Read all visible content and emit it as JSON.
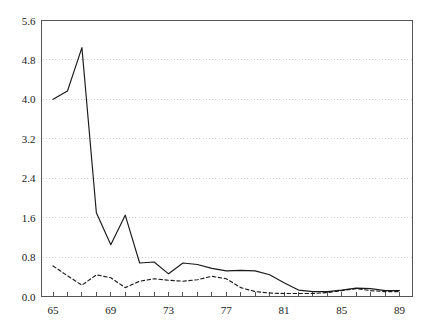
{
  "chart_data": {
    "type": "line",
    "title": "",
    "subtitle": "",
    "xlabel": "",
    "ylabel": "",
    "xlim": [
      64.2,
      89.9
    ],
    "ylim": [
      0.0,
      5.6
    ],
    "grid": "horizontal-dotted",
    "legend": "none",
    "xticks": [
      65,
      66,
      67,
      68,
      69,
      70,
      71,
      72,
      73,
      74,
      75,
      76,
      77,
      78,
      79,
      80,
      81,
      82,
      83,
      84,
      85,
      86,
      87,
      88,
      89
    ],
    "xtick_labels": [
      "65",
      "",
      "",
      "",
      "69",
      "",
      "",
      "",
      "73",
      "",
      "",
      "",
      "77",
      "",
      "",
      "",
      "81",
      "",
      "",
      "",
      "85",
      "",
      "",
      "",
      "89"
    ],
    "yticks": [
      0.0,
      0.8,
      1.6,
      2.4,
      3.2,
      4.0,
      4.8,
      5.6
    ],
    "ytick_labels": [
      "0.0",
      "0.8",
      "1.6",
      "2.4",
      "3.2",
      "4.0",
      "4.8",
      "5.6"
    ],
    "x": [
      65,
      66,
      67,
      68,
      69,
      70,
      71,
      72,
      73,
      74,
      75,
      76,
      77,
      78,
      79,
      80,
      81,
      82,
      83,
      84,
      85,
      86,
      87,
      88,
      89
    ],
    "series": [
      {
        "name": "solid-series",
        "style": "solid",
        "color": "#1a1a1a",
        "values": [
          4.0,
          4.17,
          5.05,
          1.7,
          1.05,
          1.65,
          0.68,
          0.7,
          0.46,
          0.68,
          0.65,
          0.57,
          0.52,
          0.53,
          0.52,
          0.44,
          0.28,
          0.13,
          0.1,
          0.1,
          0.13,
          0.17,
          0.16,
          0.12,
          0.12
        ]
      },
      {
        "name": "dashed-series",
        "style": "dashed",
        "color": "#1a1a1a",
        "values": [
          0.62,
          0.42,
          0.23,
          0.44,
          0.38,
          0.18,
          0.31,
          0.36,
          0.33,
          0.31,
          0.34,
          0.41,
          0.36,
          0.18,
          0.1,
          0.07,
          0.06,
          0.06,
          0.06,
          0.08,
          0.12,
          0.16,
          0.12,
          0.1,
          0.1
        ]
      }
    ],
    "colors": {
      "axis": "#555555",
      "frame": "#555555",
      "grid": "#cfcfcf",
      "line": "#1a1a1a",
      "background": "#ffffff"
    }
  }
}
